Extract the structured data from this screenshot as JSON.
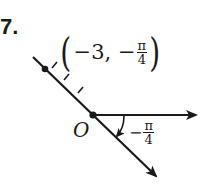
{
  "problem": {
    "number": "7."
  },
  "point": {
    "prefix": "−3, −",
    "frac_num": "π",
    "frac_den": "4",
    "open": "(",
    "close": ")"
  },
  "origin": {
    "label": "O"
  },
  "angle": {
    "sign": "−",
    "frac_num": "π",
    "frac_den": "4"
  },
  "colors": {
    "ink": "#1a1a1a",
    "background": "#ffffff"
  }
}
